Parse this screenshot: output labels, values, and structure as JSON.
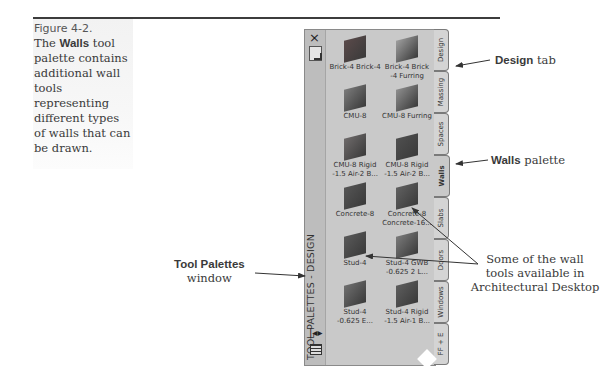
{
  "caption": {
    "figure_label": "Figure 4-2.",
    "text_before": "The ",
    "text_bold": "Walls",
    "text_after": " tool palette contains additional wall tools representing different types of walls that can be drawn."
  },
  "palette": {
    "title": "TOOL PALETTES - DESIGN",
    "close_icon": "×",
    "autohide_icon": "|◂▸",
    "tools": [
      {
        "label": "Brick-4 Brick-4",
        "color": "#5a4a4a"
      },
      {
        "label": "Brick-4 Brick\n-4 Furring",
        "color": "#9e9e9e"
      },
      {
        "label": "CMU-8",
        "color": "#7b7b7b"
      },
      {
        "label": "CMU-8 Furring",
        "color": "#8e8e8e"
      },
      {
        "label": "CMU-8 Rigid\n-1.5 Air-2 B...",
        "color": "#6e6a6a"
      },
      {
        "label": "CMU-8 Rigid\n-1.5 Air-2 B...",
        "color": "#4f4f4f"
      },
      {
        "label": "Concrete-8",
        "color": "#555555"
      },
      {
        "label": "Concrete-8\nConcrete-16...",
        "color": "#606060"
      },
      {
        "label": "Stud-4",
        "color": "#595959"
      },
      {
        "label": "Stud-4 GWB\n-0.625 2 L...",
        "color": "#7a7a7a"
      },
      {
        "label": "Stud-4\n-0.625 E...",
        "color": "#6f6f6f"
      },
      {
        "label": "Stud-4 Rigid\n-1.5 Air-1 B...",
        "color": "#5d5d5d"
      }
    ],
    "tabs": [
      {
        "label": "Design",
        "active": false
      },
      {
        "label": "Massing",
        "active": false
      },
      {
        "label": "Spaces",
        "active": false
      },
      {
        "label": "Walls",
        "active": true
      },
      {
        "label": "Slabs",
        "active": false
      },
      {
        "label": "Doors",
        "active": false
      },
      {
        "label": "Windows",
        "active": false
      },
      {
        "label": "FF + E",
        "active": false
      }
    ]
  },
  "callouts": {
    "design_tab": {
      "bold": "Design",
      "text": " tab"
    },
    "walls_palette": {
      "bold": "Walls",
      "text": " palette"
    },
    "tool_palettes": {
      "bold": "Tool Palettes",
      "text": "window"
    },
    "wall_tools": {
      "line1": "Some of the wall",
      "line2": "tools available in",
      "line3": "Architectural Desktop"
    }
  }
}
